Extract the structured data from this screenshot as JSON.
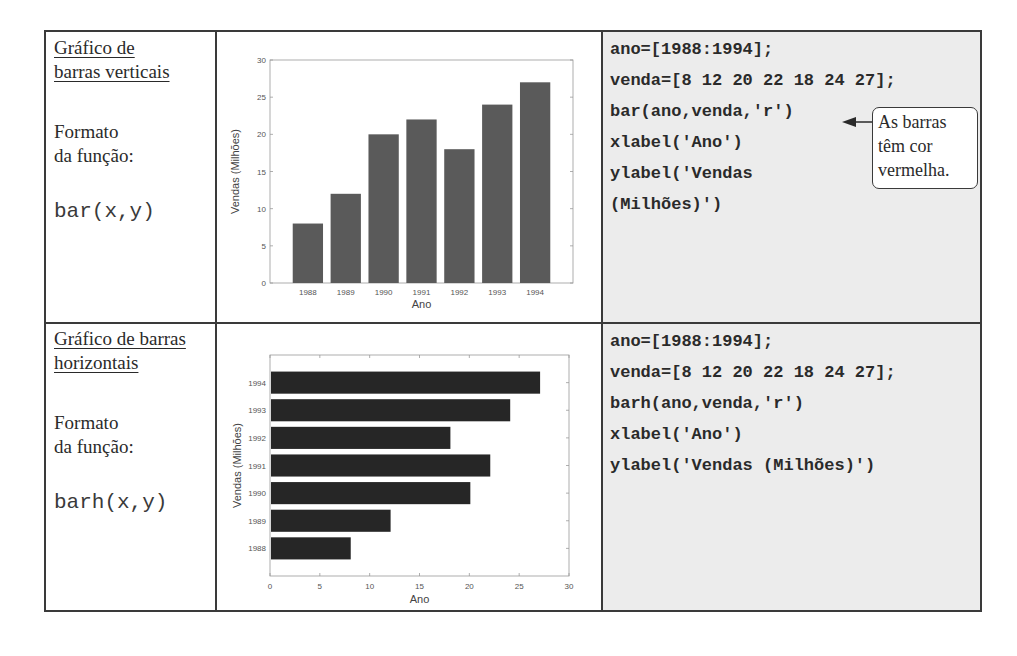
{
  "rows": [
    {
      "title_line1": "Gráfico de",
      "title_line2": "barras verticais",
      "format_line1": "Formato",
      "format_line2": "da função:",
      "signature": "bar(x,y)",
      "code": [
        "ano=[1988:1994];",
        "venda=[8 12 20 22 18 24 27];",
        "bar(ano,venda,'r')",
        "xlabel('Ano')",
        "ylabel('Vendas",
        "(Milhões)')"
      ],
      "callout": {
        "line1": "As barras",
        "line2": "têm cor",
        "line3": "vermelha."
      }
    },
    {
      "title_line1": "Gráfico de barras",
      "title_line2": "horizontais",
      "format_line1": "Formato",
      "format_line2": "da função:",
      "signature": "barh(x,y)",
      "code": [
        "ano=[1988:1994];",
        "venda=[8 12 20 22 18 24 27];",
        "barh(ano,venda,'r')",
        "xlabel('Ano')",
        "ylabel('Vendas (Milhões)')"
      ]
    }
  ],
  "chart_data": [
    {
      "type": "bar",
      "orientation": "vertical",
      "categories": [
        "1988",
        "1989",
        "1990",
        "1991",
        "1992",
        "1993",
        "1994"
      ],
      "values": [
        8,
        12,
        20,
        22,
        18,
        24,
        27
      ],
      "title": "",
      "xlabel": "Ano",
      "ylabel": "Vendas (Milhões)",
      "ylim": [
        0,
        30
      ],
      "yticks": [
        "0",
        "5",
        "10",
        "15",
        "20",
        "25",
        "30"
      ],
      "grid": false,
      "bar_color": "#5a5a5a"
    },
    {
      "type": "bar",
      "orientation": "horizontal",
      "categories": [
        "1988",
        "1989",
        "1990",
        "1991",
        "1992",
        "1993",
        "1994"
      ],
      "values": [
        8,
        12,
        20,
        22,
        18,
        24,
        27
      ],
      "title": "",
      "xlabel": "Ano",
      "ylabel": "Vendas (Milhões)",
      "xlim": [
        0,
        30
      ],
      "xticks": [
        "0",
        "5",
        "10",
        "15",
        "20",
        "25",
        "30"
      ],
      "grid": false,
      "bar_color": "#262626"
    }
  ]
}
